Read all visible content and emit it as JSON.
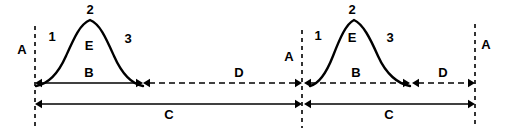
{
  "diagram": {
    "background_color": "#ffffff",
    "line_color": "#000000",
    "width": 505,
    "height": 133,
    "axis_markers": [
      {
        "id": "axis-left",
        "label": "A",
        "x": 35,
        "label_x": 22,
        "label_y": 54,
        "y_top": 26,
        "y_bottom": 128
      },
      {
        "id": "axis-middle",
        "label": "A",
        "x": 302,
        "label_x": 289,
        "label_y": 61,
        "y_top": 30,
        "y_bottom": 128
      },
      {
        "id": "axis-right",
        "label": "A",
        "x": 475,
        "label_x": 486,
        "label_y": 49,
        "y_top": 24,
        "y_bottom": 128
      }
    ],
    "peaks": [
      {
        "id": "peak-left",
        "path": "M 36 86 C 48 84 58 74 66 56 C 74 38 80 24 90 20 C 100 24 106 38 114 56 C 122 74 132 84 143 86",
        "segment_labels": [
          {
            "id": "rise-label-left",
            "text": "1",
            "x": 52,
            "y": 41
          },
          {
            "id": "peak-label-left",
            "text": "2",
            "x": 90,
            "y": 14
          },
          {
            "id": "fall-label-left",
            "text": "3",
            "x": 128,
            "y": 43
          },
          {
            "id": "area-label-left",
            "text": "E",
            "x": 89,
            "y": 50
          }
        ]
      },
      {
        "id": "peak-right",
        "path": "M 310 86 C 318 84 326 74 333 56 C 340 38 346 24 354 20 C 363 24 370 38 378 56 C 386 74 398 84 410 86",
        "segment_labels": [
          {
            "id": "rise-label-right",
            "text": "1",
            "x": 318,
            "y": 40
          },
          {
            "id": "peak-label-right",
            "text": "2",
            "x": 352,
            "y": 14
          },
          {
            "id": "fall-label-right",
            "text": "3",
            "x": 390,
            "y": 42
          },
          {
            "id": "area-label-right",
            "text": "E",
            "x": 352,
            "y": 42
          }
        ]
      }
    ],
    "dimensions": [
      {
        "id": "dim-b-left",
        "label": "B",
        "style": "solid",
        "x1": 35,
        "x2": 143,
        "y": 83,
        "label_x": 89,
        "label_y": 77,
        "arrow_start": true,
        "arrow_end": true
      },
      {
        "id": "dim-d-left",
        "label": "D",
        "style": "dashed",
        "x1": 143,
        "x2": 302,
        "y": 83,
        "label_x": 239,
        "label_y": 77,
        "arrow_start": true,
        "arrow_end": true
      },
      {
        "id": "dim-c-left",
        "label": "C",
        "style": "solid",
        "x1": 35,
        "x2": 302,
        "y": 104,
        "label_x": 169,
        "label_y": 119,
        "arrow_start": true,
        "arrow_end": true
      },
      {
        "id": "dim-b-right",
        "label": "B",
        "style": "dashed",
        "x1": 304,
        "x2": 410,
        "y": 83,
        "label_x": 356,
        "label_y": 77,
        "arrow_start": true,
        "arrow_end": true
      },
      {
        "id": "dim-d-right",
        "label": "D",
        "style": "dashed",
        "x1": 412,
        "x2": 475,
        "y": 83,
        "label_x": 443,
        "label_y": 77,
        "arrow_start": true,
        "arrow_end": true
      },
      {
        "id": "dim-c-right",
        "label": "C",
        "style": "solid",
        "x1": 304,
        "x2": 475,
        "y": 104,
        "label_x": 389,
        "label_y": 119,
        "arrow_start": true,
        "arrow_end": true
      }
    ]
  }
}
